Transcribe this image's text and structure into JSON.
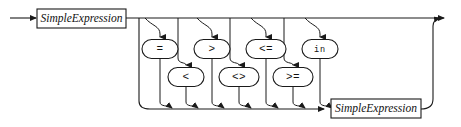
{
  "diagram": {
    "kind": "railroad-syntax-diagram",
    "title": "Expression",
    "background_color": "#ffffff",
    "line_color": "#1a1a1a",
    "entry": {
      "name": "entry-arrow",
      "x": 10,
      "y": 18
    },
    "exit": {
      "name": "exit-arrow",
      "x": 451,
      "y": 18
    },
    "nonterminals": [
      {
        "id": "simple-expression-left",
        "label": "SimpleExpression",
        "x": 37,
        "y": 9,
        "width": 89,
        "height": 19
      },
      {
        "id": "simple-expression-right",
        "label": "SimpleExpression",
        "x": 331,
        "y": 99,
        "width": 90,
        "height": 19
      }
    ],
    "terminals_row_top": [
      {
        "id": "op-equal",
        "label": "=",
        "cx": 160,
        "cy": 49,
        "rx": 18,
        "ry": 9.5,
        "branch_x": 145,
        "drop_x": 160
      },
      {
        "id": "op-greater",
        "label": ">",
        "cx": 212,
        "cy": 49,
        "rx": 18,
        "ry": 9.5,
        "branch_x": 197,
        "drop_x": 212
      },
      {
        "id": "op-less-equal",
        "label": "<=",
        "cx": 266,
        "cy": 49,
        "rx": 20,
        "ry": 9.5,
        "branch_x": 251,
        "drop_x": 266
      },
      {
        "id": "op-in",
        "label": "in",
        "cx": 320,
        "cy": 49,
        "rx": 18,
        "ry": 9.5,
        "branch_x": 305,
        "drop_x": 320
      }
    ],
    "terminals_row_bottom": [
      {
        "id": "op-less",
        "label": "<",
        "cx": 186,
        "cy": 77,
        "rx": 18,
        "ry": 9.5,
        "feed_x": 186,
        "source_x": 178
      },
      {
        "id": "op-not-equal",
        "label": "<>",
        "cx": 239,
        "cy": 77,
        "rx": 20,
        "ry": 9.5,
        "feed_x": 239,
        "source_x": 230
      },
      {
        "id": "op-greater-equal",
        "label": ">=",
        "cx": 293,
        "cy": 77,
        "rx": 20,
        "ry": 9.5,
        "feed_x": 293,
        "source_x": 284
      }
    ],
    "rails": {
      "main_line_y": 18,
      "bottom_rail_y": 109,
      "loop_left_x": 139,
      "loop_right_x": 433,
      "top_line_start_x": 10,
      "top_line_end_x": 451
    },
    "grammar_text": "SimpleExpression [ ( = | > | <= | in | < | <> | >= ) SimpleExpression ]"
  }
}
